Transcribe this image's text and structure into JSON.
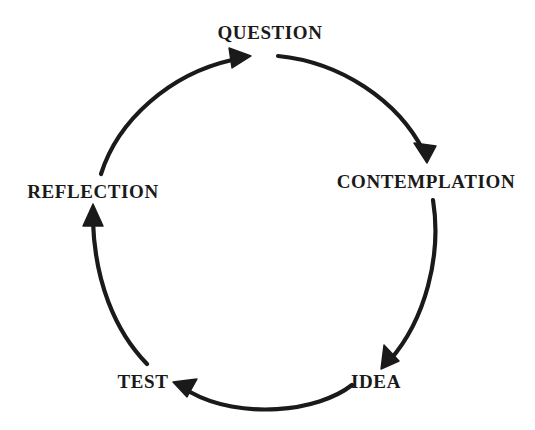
{
  "diagram": {
    "type": "cyclical-process",
    "direction": "clockwise",
    "background_color": "#ffffff",
    "stroke_color": "#1a1a1a",
    "text_color": "#1a1a1a",
    "nodes": [
      {
        "id": "question",
        "label": "QUESTION",
        "position": "top"
      },
      {
        "id": "contemplation",
        "label": "CONTEMPLATION",
        "position": "right-upper"
      },
      {
        "id": "idea",
        "label": "IDEA",
        "position": "right-lower"
      },
      {
        "id": "test",
        "label": "TEST",
        "position": "left-lower"
      },
      {
        "id": "reflection",
        "label": "REFLECTION",
        "position": "left-upper"
      }
    ],
    "arrows": [
      {
        "id": "arrow-question-to-contemplation",
        "from": "question",
        "to": "contemplation"
      },
      {
        "id": "arrow-contemplation-to-idea",
        "from": "contemplation",
        "to": "idea"
      },
      {
        "id": "arrow-idea-to-test",
        "from": "idea",
        "to": "test"
      },
      {
        "id": "arrow-test-to-reflection",
        "from": "test",
        "to": "reflection"
      },
      {
        "id": "arrow-reflection-to-question",
        "from": "reflection",
        "to": "question"
      }
    ]
  }
}
